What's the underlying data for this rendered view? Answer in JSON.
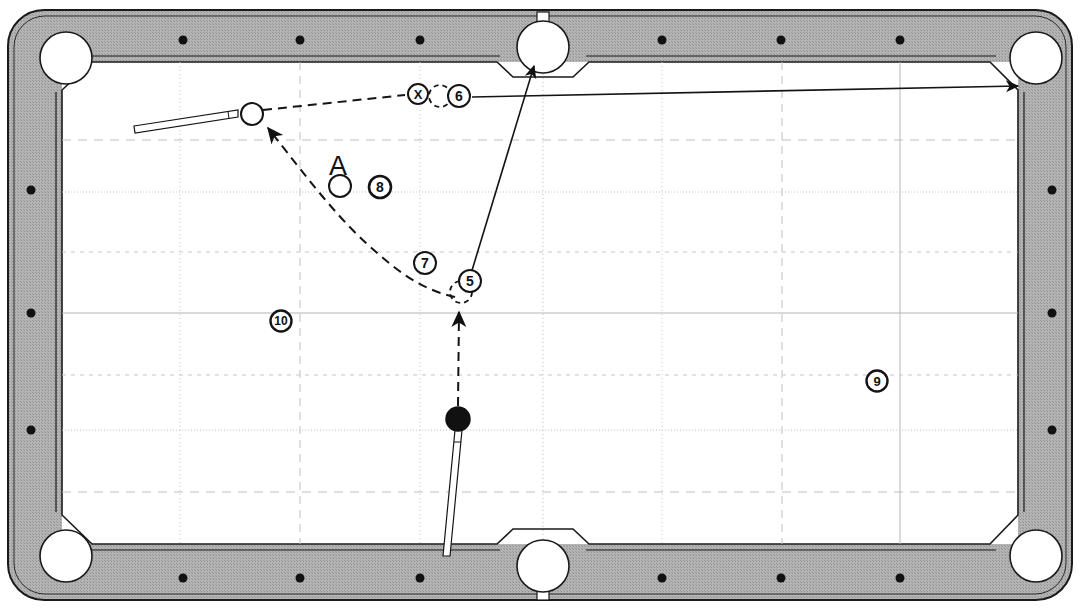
{
  "diagram": {
    "type": "billiards-shot-diagram",
    "colors": {
      "rail": "#b0b0b0",
      "rail_stroke": "#1a1a1a",
      "cloth": "#ffffff",
      "line": "#1a1a1a",
      "grid_solid": "#b5b5b5",
      "grid_dashed": "#bdbdbd",
      "grid_dotted": "#c6c6c6",
      "ball_fill": "#ffffff",
      "object_ball_fill": "#111111"
    },
    "table": {
      "outer": {
        "x": 8,
        "y": 10,
        "w": 1064,
        "h": 590
      },
      "rail_width": 44,
      "playfield": {
        "x": 62,
        "y": 62,
        "w": 956,
        "h": 482
      },
      "corner_radius": 34
    },
    "pockets": [
      {
        "name": "pocket-top-left",
        "cx": 66,
        "cy": 58,
        "r": 26
      },
      {
        "name": "pocket-top-middle",
        "cx": 543,
        "cy": 47,
        "r": 26
      },
      {
        "name": "pocket-top-right",
        "cx": 1036,
        "cy": 58,
        "r": 26
      },
      {
        "name": "pocket-bottom-left",
        "cx": 66,
        "cy": 556,
        "r": 26
      },
      {
        "name": "pocket-bottom-middle",
        "cx": 543,
        "cy": 566,
        "r": 26
      },
      {
        "name": "pocket-bottom-right",
        "cx": 1036,
        "cy": 556,
        "r": 26
      }
    ],
    "rail_diamonds": {
      "top": [
        {
          "x": 183,
          "y": 40
        },
        {
          "x": 300,
          "y": 40
        },
        {
          "x": 420,
          "y": 40
        },
        {
          "x": 662,
          "y": 40
        },
        {
          "x": 781,
          "y": 40
        },
        {
          "x": 900,
          "y": 40
        }
      ],
      "bottom": [
        {
          "x": 183,
          "y": 578
        },
        {
          "x": 300,
          "y": 578
        },
        {
          "x": 420,
          "y": 578
        },
        {
          "x": 662,
          "y": 578
        },
        {
          "x": 781,
          "y": 578
        },
        {
          "x": 900,
          "y": 578
        }
      ],
      "left": [
        {
          "x": 31,
          "y": 190
        },
        {
          "x": 31,
          "y": 313
        },
        {
          "x": 31,
          "y": 430
        }
      ],
      "right": [
        {
          "x": 1052,
          "y": 190
        },
        {
          "x": 1052,
          "y": 313
        },
        {
          "x": 1052,
          "y": 430
        }
      ]
    },
    "grid": {
      "x_lines": [
        180,
        300,
        420,
        543,
        662,
        782,
        900
      ],
      "y_lines": [
        140,
        192,
        252,
        313,
        375,
        430,
        492
      ],
      "styles": [
        "dashed",
        "dotted",
        "dashed",
        "solid",
        "dashed",
        "dotted",
        "dashed"
      ]
    },
    "balls": [
      {
        "name": "cue-ball",
        "cx": 252,
        "cy": 114,
        "r": 11,
        "fill": "white",
        "label": ""
      },
      {
        "name": "ball-a",
        "cx": 340,
        "cy": 186,
        "r": 11,
        "fill": "white",
        "label": "A"
      },
      {
        "name": "object-ball",
        "cx": 458,
        "cy": 419,
        "r": 12,
        "fill": "black",
        "label": ""
      }
    ],
    "ghost_balls": [
      {
        "name": "ghost-ball-6",
        "cx": 440,
        "cy": 96,
        "r": 11
      },
      {
        "name": "ghost-ball-5",
        "cx": 461,
        "cy": 292,
        "r": 11
      }
    ],
    "markers": [
      {
        "name": "marker-x",
        "cx": 418,
        "cy": 94,
        "r": 10,
        "text": "X"
      }
    ],
    "callouts": [
      {
        "name": "callout-5",
        "cx": 470,
        "cy": 281,
        "r": 11,
        "text": "5"
      },
      {
        "name": "callout-6",
        "cx": 459,
        "cy": 96,
        "r": 11,
        "text": "6"
      },
      {
        "name": "callout-7",
        "cx": 425,
        "cy": 263,
        "r": 11,
        "text": "7"
      },
      {
        "name": "callout-8",
        "cx": 380,
        "cy": 187,
        "r": 11,
        "text": "8"
      },
      {
        "name": "callout-9",
        "cx": 877,
        "cy": 381,
        "r": 11,
        "text": "9"
      },
      {
        "name": "callout-10",
        "cx": 281,
        "cy": 321,
        "r": 11,
        "text": "10"
      }
    ],
    "text_labels": [
      {
        "name": "label-a",
        "x": 338,
        "y": 166,
        "text": "A",
        "size": 26
      }
    ],
    "paths": {
      "cue_stick_top": {
        "name": "cue-stick-top",
        "x1": 134,
        "y1": 133,
        "x2": 240,
        "y2": 113
      },
      "cue_stick_bottom": {
        "name": "cue-stick-bottom",
        "x1": 445,
        "y1": 556,
        "x2": 458,
        "y2": 432
      },
      "dashed_cue_to_six": {
        "name": "path-cueball-to-ghost6",
        "points": "263,110 405,95"
      },
      "dashed_a_to_cue": {
        "name": "path-a-to-cueball",
        "points": "455,296 395,287 350,244 266,127"
      },
      "dashed_object_to_five": {
        "name": "path-objectball-to-ghost5",
        "points": "458,407 459,310"
      },
      "solid_five_to_pocket": {
        "name": "path-ghost5-to-top-middle-pocket",
        "points": "468,278 535,64"
      },
      "solid_six_to_corner": {
        "name": "path-ghost6-to-top-right-pocket",
        "points": "472,97 1022,86"
      }
    }
  }
}
